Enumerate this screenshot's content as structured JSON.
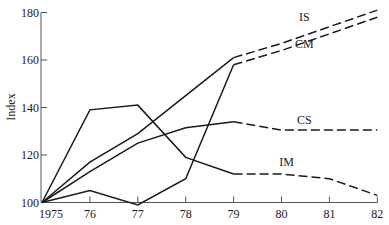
{
  "chart_data": {
    "type": "line",
    "title": "",
    "xlabel": "",
    "ylabel": "Index",
    "x": [
      "1975",
      "76",
      "77",
      "78",
      "79",
      "80",
      "81",
      "82"
    ],
    "ylim": [
      100,
      180
    ],
    "yticks": [
      "100",
      "120",
      "140",
      "160",
      "180"
    ],
    "grid": false,
    "legend": "inline labels at line ends",
    "actual_through": "79",
    "projected_from": "79",
    "series": [
      {
        "name": "IS",
        "values": [
          100,
          117,
          129,
          145,
          161,
          167,
          174,
          181
        ],
        "label_anchor_index": 6,
        "label_dy": -10
      },
      {
        "name": "CM",
        "values": [
          100,
          105,
          99,
          110,
          158,
          164,
          171,
          178
        ],
        "label_anchor_index": 6,
        "label_dy": 14
      },
      {
        "name": "CS",
        "values": [
          100,
          113,
          125,
          131.5,
          134,
          130.5,
          130.5,
          130.5
        ],
        "label_anchor_index": 6,
        "label_dy": -10
      },
      {
        "name": "IM",
        "values": [
          100,
          139,
          141,
          119,
          112,
          112,
          110,
          103
        ],
        "label_anchor_index": 5,
        "label_dy": -12
      }
    ],
    "line_color": "#1a1a1a"
  }
}
